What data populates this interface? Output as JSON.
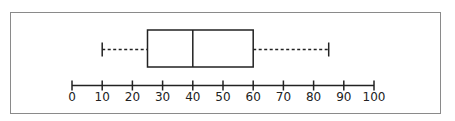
{
  "chart_data": {
    "type": "boxplot",
    "title": "",
    "xlabel": "",
    "ylabel": "",
    "xlim": [
      0,
      100
    ],
    "ticks": [
      0,
      10,
      20,
      30,
      40,
      50,
      60,
      70,
      80,
      90,
      100
    ],
    "tick_labels": [
      "0",
      "10",
      "20",
      "30",
      "40",
      "50",
      "60",
      "70",
      "80",
      "90",
      "100"
    ],
    "box": {
      "min": 10,
      "q1": 25,
      "median": 40,
      "q3": 60,
      "max": 85
    },
    "whisker_style": "dashed",
    "grid": false,
    "legend": null
  },
  "colors": {
    "line": "#222222",
    "frame": "#8a8a8a",
    "background": "#ffffff"
  }
}
